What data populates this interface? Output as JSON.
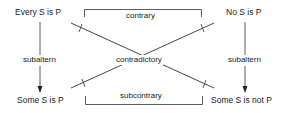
{
  "diagram": {
    "corners": {
      "top_left": "Every S is P",
      "top_right": "No S is P",
      "bottom_left": "Some S is P",
      "bottom_right": "Some S is not P"
    },
    "relations": {
      "top": "contrary",
      "bottom": "subcontrary",
      "diagonal": "contradictory",
      "left": "subaltern",
      "right": "subaltern"
    },
    "colors": {
      "line": "#333333",
      "text": "#1a1a1a",
      "background": "#ffffff"
    }
  }
}
